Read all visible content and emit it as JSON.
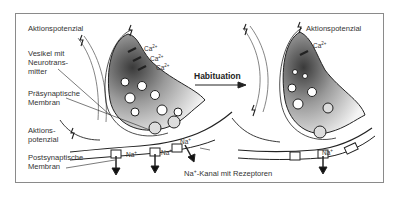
{
  "figure": {
    "labels_left": {
      "aktionspotenzial_top": "Aktionspotenzial",
      "vesikel": [
        "Vesikel mit",
        "Neurotrans-",
        "mitter"
      ],
      "praesynaptisch": [
        "Präsynaptische",
        "Membran"
      ],
      "aktionspotenzial_mid": [
        "Aktions-",
        "potenzial"
      ],
      "postsynaptisch": [
        "Postsynaptische",
        "Membran"
      ]
    },
    "ions_left": {
      "ca": [
        "Ca",
        "Ca",
        "Ca"
      ],
      "ca_charge": "2+",
      "na": [
        "Na",
        "Na",
        "Na"
      ],
      "na_charge": "+"
    },
    "kanal_label": {
      "na": "Na",
      "charge": "+",
      "text": "-Kanal mit Rezeptoren"
    },
    "arrow_label": "Habituation",
    "labels_right": {
      "aktionspotenzial": "Aktionspotenzial",
      "ca": "Ca",
      "ca_charge": "2+",
      "na": "Na",
      "na_charge": "+"
    }
  }
}
